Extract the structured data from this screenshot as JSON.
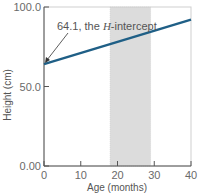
{
  "chart_data": {
    "type": "line",
    "title": "",
    "xlabel": "Age (months)",
    "ylabel": "Height (cm)",
    "xlim": [
      0,
      40
    ],
    "ylim": [
      0,
      100
    ],
    "x_ticks": [
      0,
      10,
      20,
      30,
      40
    ],
    "x_tick_labels": [
      "0",
      "10",
      "20",
      "30",
      "40"
    ],
    "y_ticks": [
      0,
      50,
      100
    ],
    "y_tick_labels": [
      "0.00",
      "50.0",
      "100.0"
    ],
    "grid": false,
    "legend": null,
    "series": [
      {
        "name": "Height vs age",
        "x": [
          0,
          40
        ],
        "y": [
          64.1,
          92
        ],
        "color": "#1f5f86"
      }
    ],
    "shaded_region": {
      "x_start": 18,
      "x_end": 29,
      "color": "#dcdcdc"
    },
    "annotations": [
      {
        "text_prefix": "64.1, the ",
        "text_var": "H",
        "text_suffix": "-intercept",
        "points_to": [
          0,
          64.1
        ]
      }
    ]
  }
}
